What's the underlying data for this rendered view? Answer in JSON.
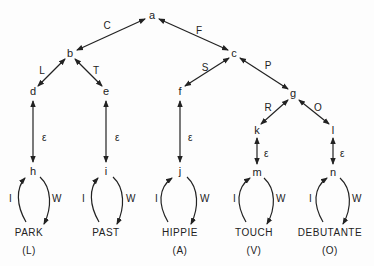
{
  "nodes": {
    "a": "a",
    "b": "b",
    "c": "c",
    "d": "d",
    "e": "e",
    "f": "f",
    "g": "g",
    "h": "h",
    "i": "i",
    "j": "j",
    "k": "k",
    "l": "l",
    "m": "m",
    "n": "n"
  },
  "edges": {
    "a_b": "C",
    "a_c": "F",
    "b_d": "L",
    "b_e": "T",
    "c_f": "S",
    "c_g": "P",
    "g_k": "R",
    "g_l": "O",
    "epsilon": "ε"
  },
  "loops": {
    "left": "I",
    "right": "W"
  },
  "leaves": [
    {
      "word": "PARK",
      "code": "(L)"
    },
    {
      "word": "PAST",
      "code": "(L)"
    },
    {
      "word": "HIPPIE",
      "code": "(A)"
    },
    {
      "word": "TOUCH",
      "code": "(V)"
    },
    {
      "word": "DEBUTANTE",
      "code": "(O)"
    }
  ]
}
